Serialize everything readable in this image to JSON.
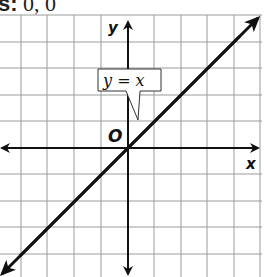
{
  "caption": {
    "prefix": "s:",
    "value": "0, 0"
  },
  "graph": {
    "x_axis_label": "x",
    "y_axis_label": "y",
    "origin_label": "O",
    "line_label": "y = x",
    "colors": {
      "grid": "#9a9a9a",
      "axes": "#111111",
      "line": "#111111",
      "background": "#ffffff"
    }
  }
}
